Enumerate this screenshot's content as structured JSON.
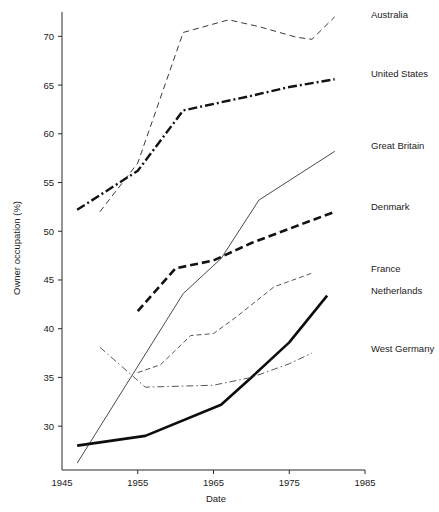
{
  "chart_data": {
    "type": "line",
    "title": "",
    "xlabel": "Date",
    "ylabel": "Owner occupation (%)",
    "xlim": [
      1945,
      1985
    ],
    "ylim": [
      25.5,
      72.5
    ],
    "xticks": [
      1945,
      1955,
      1965,
      1975,
      1985
    ],
    "xtick_labels": [
      "1945",
      "1955",
      "1965",
      "1975",
      "1985"
    ],
    "yticks": [
      30,
      35,
      40,
      45,
      50,
      55,
      60,
      65,
      70
    ],
    "ytick_labels": [
      "30",
      "35",
      "40",
      "45",
      "50",
      "55",
      "60",
      "65",
      "70"
    ],
    "grid": false,
    "legend_position": "right-inline-labels",
    "series": [
      {
        "name": "Australia",
        "label": "Australia",
        "style": "dashed",
        "color": "#3a3a3a",
        "width": 1.0,
        "dasharray": "6 4",
        "label_y": 18,
        "x": [
          1950,
          1955,
          1961,
          1967,
          1971,
          1976,
          1978,
          1981
        ],
        "y": [
          52.0,
          57.0,
          70.4,
          71.7,
          71.0,
          69.9,
          69.7,
          72.0
        ]
      },
      {
        "name": "United States",
        "label": "United States",
        "style": "dash-dot",
        "color": "#121212",
        "width": 2.4,
        "dasharray": "9 3 2 3",
        "label_y": 77,
        "x": [
          1947,
          1955,
          1961,
          1970,
          1975,
          1981
        ],
        "y": [
          52.2,
          56.2,
          62.4,
          63.9,
          64.8,
          65.6
        ]
      },
      {
        "name": "Great Britain",
        "label": "Great Britain",
        "style": "solid",
        "color": "#4a4a4a",
        "width": 1.0,
        "dasharray": "none",
        "label_y": 149,
        "x": [
          1947,
          1961,
          1966,
          1971,
          1981
        ],
        "y": [
          26.2,
          43.6,
          47.2,
          53.2,
          58.2
        ]
      },
      {
        "name": "Denmark",
        "label": "Denmark",
        "style": "dashed",
        "color": "#121212",
        "width": 2.6,
        "dasharray": "8 4",
        "label_y": 210,
        "x": [
          1955,
          1960,
          1965,
          1970,
          1981
        ],
        "y": [
          41.8,
          46.2,
          47.0,
          48.8,
          52.0
        ]
      },
      {
        "name": "France",
        "label": "France",
        "style": "short-dashed",
        "color": "#555555",
        "width": 1.0,
        "dasharray": "5 3",
        "label_y": 272,
        "x": [
          1955,
          1958,
          1962,
          1965,
          1968,
          1973,
          1978
        ],
        "y": [
          35.5,
          36.3,
          39.3,
          39.5,
          41.2,
          44.3,
          45.7
        ]
      },
      {
        "name": "Netherlands",
        "label": "Netherlands",
        "style": "solid",
        "color": "#0d0d0d",
        "width": 2.6,
        "dasharray": "none",
        "label_y": 294,
        "x": [
          1947,
          1956,
          1966,
          1970,
          1975,
          1980
        ],
        "y": [
          28.0,
          29.0,
          32.2,
          35.0,
          38.6,
          43.4
        ]
      },
      {
        "name": "West Germany",
        "label": "West Germany",
        "style": "dash-dot",
        "color": "#555555",
        "width": 1.0,
        "dasharray": "7 3 1.5 3",
        "label_y": 352,
        "x": [
          1950,
          1956,
          1965,
          1970,
          1975,
          1978
        ],
        "y": [
          38.1,
          34.0,
          34.2,
          35.0,
          36.4,
          37.5
        ]
      }
    ]
  }
}
